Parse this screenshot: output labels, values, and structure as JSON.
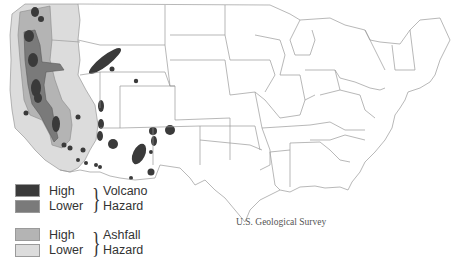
{
  "map": {
    "title": "Volcano and Ashfall Hazard Map of the Contiguous United States",
    "credit": "U.S. Geological Survey",
    "colors": {
      "volcano_high": "#3a3a3a",
      "volcano_lower": "#7a7a7a",
      "ashfall_high": "#b4b4b4",
      "ashfall_lower": "#dcdcdc",
      "state_border": "#9a9a9a",
      "background": "#ffffff"
    }
  },
  "legend": {
    "volcano": {
      "high_label": "High",
      "lower_label": "Lower",
      "category_line1": "Volcano",
      "category_line2": "Hazard"
    },
    "ashfall": {
      "high_label": "High",
      "lower_label": "Lower",
      "category_line1": "Ashfall",
      "category_line2": "Hazard"
    }
  }
}
